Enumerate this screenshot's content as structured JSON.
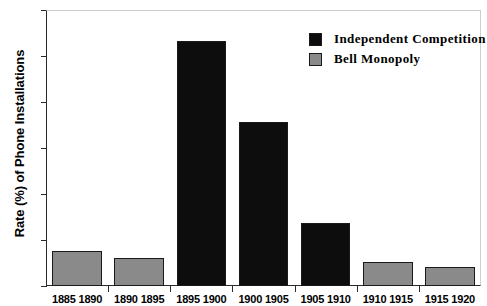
{
  "chart_data": {
    "type": "bar",
    "title": "",
    "xlabel": "",
    "ylabel": "Rate (%) of Phone Installations",
    "ylim": [
      0,
      300
    ],
    "yticks": [
      0,
      50,
      100,
      150,
      200,
      250,
      300
    ],
    "grid": false,
    "legend_position": "top-right",
    "categories": [
      "1885 1890",
      "1890 1895",
      "1895 1900",
      "1900 1905",
      "1905 1910",
      "1910 1915",
      "1915 1920"
    ],
    "series": [
      {
        "name": "Independent Competition",
        "color": "#0d0d0d",
        "values": [
          null,
          null,
          266,
          178,
          69,
          null,
          null
        ]
      },
      {
        "name": "Bell Monopoly",
        "color": "#8a8a8a",
        "values": [
          38,
          30,
          null,
          null,
          null,
          26,
          21
        ]
      }
    ],
    "bars": [
      {
        "category": "1885 1890",
        "value": 38,
        "series": "Bell Monopoly"
      },
      {
        "category": "1890 1895",
        "value": 30,
        "series": "Bell Monopoly"
      },
      {
        "category": "1895 1900",
        "value": 266,
        "series": "Independent Competition"
      },
      {
        "category": "1900 1905",
        "value": 178,
        "series": "Independent Competition"
      },
      {
        "category": "1905 1910",
        "value": 69,
        "series": "Independent Competition"
      },
      {
        "category": "1910 1915",
        "value": 26,
        "series": "Bell Monopoly"
      },
      {
        "category": "1915 1920",
        "value": 21,
        "series": "Bell Monopoly"
      }
    ]
  },
  "axes": {
    "y_title": "Rate (%) of Phone Installations",
    "y_tick_labels": [
      "300",
      "250",
      "200",
      "150",
      "100",
      "50",
      "0"
    ],
    "x_tick_labels": [
      "1885 1890",
      "1890 1895",
      "1895 1900",
      "1900 1905",
      "1905 1910",
      "1910 1915",
      "1915 1920"
    ]
  },
  "legend": {
    "entries": [
      {
        "label": "Independent Competition",
        "color": "#0d0d0d"
      },
      {
        "label": "Bell Monopoly",
        "color": "#8a8a8a"
      }
    ]
  }
}
